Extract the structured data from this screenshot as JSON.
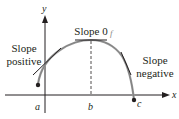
{
  "diagram": {
    "type": "function-slope-diagram",
    "axes": {
      "x_label": "x",
      "y_label": "y"
    },
    "points": [
      {
        "label": "a"
      },
      {
        "label": "b"
      },
      {
        "label": "c"
      }
    ],
    "function_label": "f",
    "annotations": {
      "slope_positive_line1": "Slope",
      "slope_positive_line2": "positive",
      "slope_zero": "Slope 0",
      "slope_negative_line1": "Slope",
      "slope_negative_line2": "negative"
    },
    "colors": {
      "axis": "#231f20",
      "curve": "#8a8a8a",
      "tangent": "#231f20",
      "text": "#231f20"
    }
  }
}
